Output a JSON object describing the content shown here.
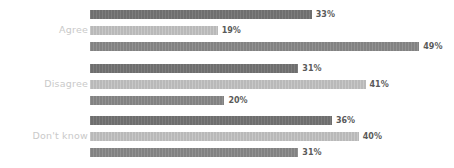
{
  "chart_data": {
    "type": "bar",
    "orientation": "horizontal",
    "title": "",
    "subtitle": "",
    "xlabel": "",
    "ylabel": "",
    "xlim": [
      0,
      54
    ],
    "grid": false,
    "legend": "none",
    "value_suffix": "%",
    "categories": [
      "Agree",
      "Disagree",
      "Don't know"
    ],
    "series": [
      {
        "name": "series-1",
        "color": "#6e6e6e",
        "values": [
          33,
          31,
          36
        ]
      },
      {
        "name": "series-2",
        "color": "#b9b9b9",
        "values": [
          19,
          41,
          40
        ]
      },
      {
        "name": "series-3",
        "color": "#828282",
        "values": [
          49,
          20,
          31
        ]
      }
    ],
    "groups": [
      {
        "label": "Agree",
        "bars": [
          {
            "series": "series-1",
            "value": 33,
            "value_label": "33%"
          },
          {
            "series": "series-2",
            "value": 19,
            "value_label": "19%"
          },
          {
            "series": "series-3",
            "value": 49,
            "value_label": "49%"
          }
        ]
      },
      {
        "label": "Disagree",
        "bars": [
          {
            "series": "series-1",
            "value": 31,
            "value_label": "31%"
          },
          {
            "series": "series-2",
            "value": 41,
            "value_label": "41%"
          },
          {
            "series": "series-3",
            "value": 20,
            "value_label": "20%"
          }
        ]
      },
      {
        "label": "Don't know",
        "bars": [
          {
            "series": "series-1",
            "value": 36,
            "value_label": "36%"
          },
          {
            "series": "series-2",
            "value": 40,
            "value_label": "40%"
          },
          {
            "series": "series-3",
            "value": 31,
            "value_label": "31%"
          }
        ]
      }
    ]
  },
  "style": {
    "background": "#ffffff",
    "label_color": "#c9c9c9",
    "value_color": "#5a5a5a"
  },
  "labels": {
    "group_0": "Agree",
    "group_1": "Disagree",
    "group_2": "Don't know",
    "v_0_0": "33%",
    "v_0_1": "19%",
    "v_0_2": "49%",
    "v_1_0": "31%",
    "v_1_1": "41%",
    "v_1_2": "20%",
    "v_2_0": "36%",
    "v_2_1": "40%",
    "v_2_2": "31%"
  }
}
